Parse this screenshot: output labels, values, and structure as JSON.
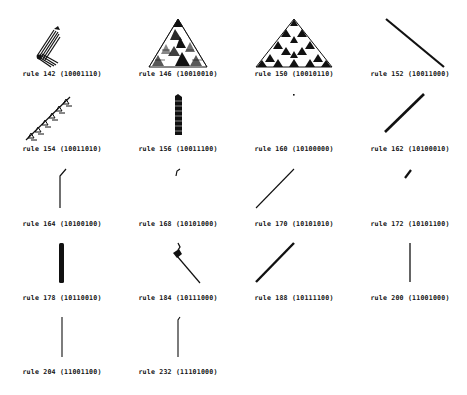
{
  "figure": {
    "colors": {
      "background": "#ffffff",
      "ink": "#111111"
    },
    "cells": [
      {
        "rule": 142,
        "binary": "10001110",
        "label": "rule 142 (10001110)",
        "pattern": "diagonal-band-left-turn"
      },
      {
        "rule": 146,
        "binary": "10010010",
        "label": "rule 146 (10010010)",
        "pattern": "sierpinski-chaotic-triangle"
      },
      {
        "rule": 150,
        "binary": "10010110",
        "label": "rule 150 (10010110)",
        "pattern": "fractal-triangle"
      },
      {
        "rule": 152,
        "binary": "10011000",
        "label": "rule 152 (10011000)",
        "pattern": "diagonal-line-down-right"
      },
      {
        "rule": 154,
        "binary": "10011010",
        "label": "rule 154 (10011010)",
        "pattern": "sierpinski-diagonal-band"
      },
      {
        "rule": 156,
        "binary": "10011100",
        "label": "rule 156 (10011100)",
        "pattern": "vertical-thick-band"
      },
      {
        "rule": 160,
        "binary": "10100000",
        "label": "rule 160 (10100000)",
        "pattern": "single-dot"
      },
      {
        "rule": 162,
        "binary": "10100010",
        "label": "rule 162 (10100010)",
        "pattern": "diagonal-thick-line-up-right"
      },
      {
        "rule": 164,
        "binary": "10100100",
        "label": "rule 164 (10100100)",
        "pattern": "vertical-line-with-hook"
      },
      {
        "rule": 168,
        "binary": "10101000",
        "label": "rule 168 (10101000)",
        "pattern": "short-hook"
      },
      {
        "rule": 170,
        "binary": "10101010",
        "label": "rule 170 (10101010)",
        "pattern": "diagonal-thin-line-up-right"
      },
      {
        "rule": 172,
        "binary": "10101100",
        "label": "rule 172 (10101100)",
        "pattern": "short-diagonal-segment"
      },
      {
        "rule": 178,
        "binary": "10110010",
        "label": "rule 178 (10110010)",
        "pattern": "vertical-thick-bar"
      },
      {
        "rule": 184,
        "binary": "10111000",
        "label": "rule 184 (10111000)",
        "pattern": "blob-then-diagonal-down-right"
      },
      {
        "rule": 188,
        "binary": "10111100",
        "label": "rule 188 (10111100)",
        "pattern": "diagonal-thick-line-up-right"
      },
      {
        "rule": 200,
        "binary": "11001000",
        "label": "rule 200 (11001000)",
        "pattern": "vertical-thin-line"
      },
      {
        "rule": 204,
        "binary": "11001100",
        "label": "rule 204 (11001100)",
        "pattern": "vertical-thin-line"
      },
      {
        "rule": 232,
        "binary": "11101000",
        "label": "rule 232 (11101000)",
        "pattern": "vertical-thin-line-with-tick"
      }
    ]
  }
}
